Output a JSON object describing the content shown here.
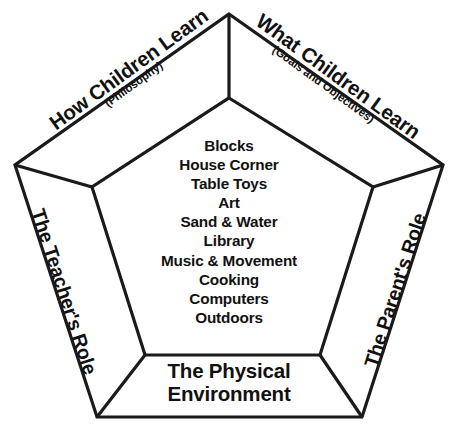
{
  "diagram": {
    "type": "nested-pentagon",
    "stroke_color": "#1a1a1a",
    "fill_color": "#ffffff",
    "text_color": "#111111",
    "bands": [
      {
        "id": "how-children-learn",
        "position": "top-left",
        "title": "How Children Learn",
        "subtitle": "(Philosophy)",
        "rotation_deg": -36
      },
      {
        "id": "what-children-learn",
        "position": "top-right",
        "title": "What Children Learn",
        "subtitle": "(Goals and Objectives)",
        "rotation_deg": 36
      },
      {
        "id": "teachers-role",
        "position": "left",
        "title": "The Teacher's Role",
        "subtitle": "",
        "rotation_deg": 72
      },
      {
        "id": "parents-role",
        "position": "right",
        "title": "The Parent's Role",
        "subtitle": "",
        "rotation_deg": -72
      },
      {
        "id": "physical-environment",
        "position": "bottom",
        "title_line1": "The Physical",
        "title_line2": "Environment",
        "subtitle": "",
        "rotation_deg": 0
      }
    ],
    "center": {
      "label": "Learning Centers",
      "items": [
        "Blocks",
        "House Corner",
        "Table Toys",
        "Art",
        "Sand & Water",
        "Library",
        "Music & Movement",
        "Cooking",
        "Computers",
        "Outdoors"
      ]
    },
    "geometry": {
      "outer_vertices": "229,14 443,165 362,417 97,417 15,165",
      "inner_vertices": "229,98 373,187 320,355 145,355 92,187",
      "spokes": [
        "229,14 229,98",
        "443,165 373,187",
        "362,417 320,355",
        "97,417 145,355",
        "15,165 92,187"
      ]
    }
  }
}
